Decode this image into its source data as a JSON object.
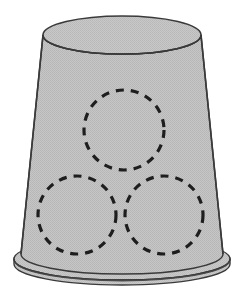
{
  "figure": {
    "background_color": "#FFFFFF",
    "canvas": {
      "width": 245,
      "height": 304
    }
  },
  "colors": {
    "body_fill": "#BDBDBD",
    "body_fill_light": "#C9C9C9",
    "outline": "#3A3A3A",
    "rim_fill": "#C4C4C4",
    "top_face_fill": "#C2C2C2",
    "dash_stroke": "#1E1E1E",
    "texture_dot": "#AFAFAF"
  },
  "body": {
    "name": "bucket-body",
    "shape": "truncated-cone-inverted",
    "top_ellipse": {
      "cx": 122,
      "cy": 35,
      "rx": 79,
      "ry": 19
    },
    "bottom_ellipse": {
      "cx": 122,
      "cy": 262,
      "rx": 101,
      "ry": 20
    },
    "outline_width": 1.4
  },
  "rim": {
    "name": "bucket-rim",
    "outer_ellipse": {
      "cx": 122,
      "cy": 262,
      "rx": 108,
      "ry": 21
    },
    "inner_ellipse": {
      "cx": 122,
      "cy": 258,
      "rx": 101,
      "ry": 20
    },
    "thickness": 7,
    "outline_width": 1.4
  },
  "top_face": {
    "name": "bucket-top-face",
    "ellipse": {
      "cx": 122,
      "cy": 35,
      "rx": 79,
      "ry": 19
    },
    "label": "top face ellipse"
  },
  "circles": [
    {
      "name": "dashed-circle-top",
      "position_label": "top",
      "cx": 124,
      "cy": 130,
      "r": 40,
      "stroke": "#1E1E1E",
      "stroke_width": 3.2,
      "dash_pattern": "8 7"
    },
    {
      "name": "dashed-circle-bottom-left",
      "position_label": "bottom-left",
      "cx": 77,
      "cy": 215,
      "r": 39,
      "stroke": "#1E1E1E",
      "stroke_width": 3.2,
      "dash_pattern": "8 7"
    },
    {
      "name": "dashed-circle-bottom-right",
      "position_label": "bottom-right",
      "cx": 164,
      "cy": 215,
      "r": 39,
      "stroke": "#1E1E1E",
      "stroke_width": 3.2,
      "dash_pattern": "8 7"
    }
  ]
}
